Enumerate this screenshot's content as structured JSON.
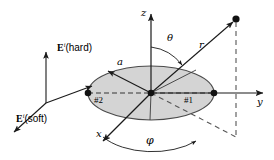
{
  "figure": {
    "name": "spherical-coordinate-disk-scattering-geometry",
    "background_color": "#ffffff",
    "line_color": "#1a1a1a",
    "disk_fill_color": "#d4d4d4",
    "disk_edge_color": "#4a4a4a"
  },
  "axes": {
    "z_label": "z",
    "y_label": "y",
    "x_label": "x"
  },
  "angles": {
    "theta_label": "θ",
    "phi_label": "φ"
  },
  "vectors": {
    "r_label": "r",
    "a_label": "a"
  },
  "disk": {
    "point1_label": "#1",
    "point2_label": "#2"
  },
  "incident": {
    "hard": {
      "symbol": "E",
      "superscript": "i",
      "qualifier": "(hard)"
    },
    "soft": {
      "symbol": "E",
      "superscript": "i",
      "qualifier": "(soft)"
    }
  }
}
